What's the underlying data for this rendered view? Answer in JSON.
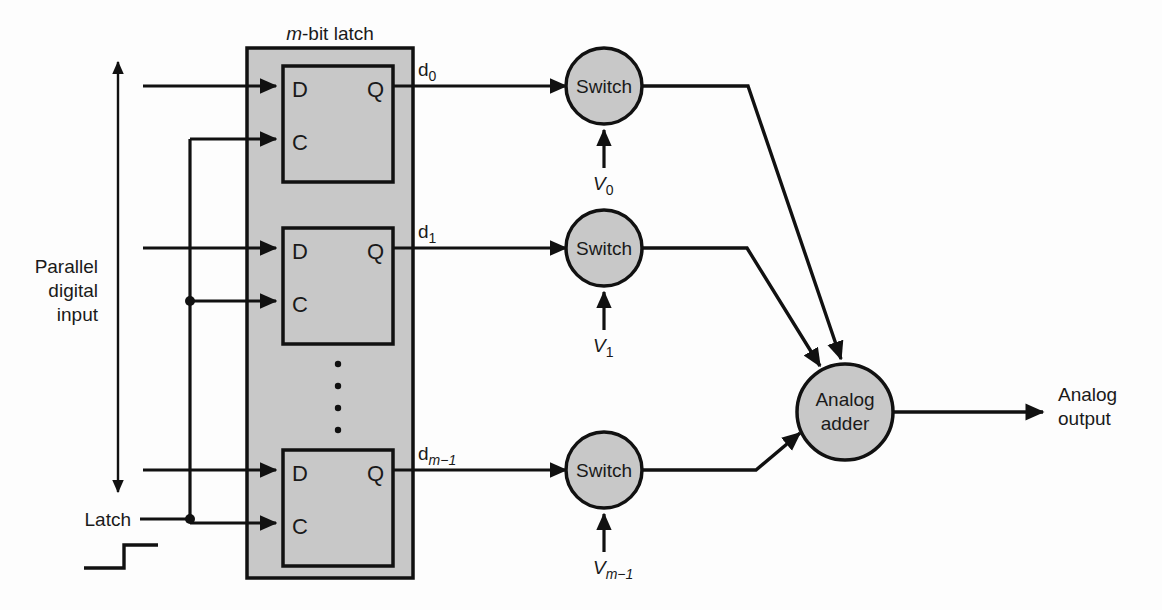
{
  "figure": {
    "type": "block-diagram",
    "title": "m-bit latch",
    "background_color": "#fdfdfd",
    "block_fill": "#c8c8c8",
    "line_color": "#111111"
  },
  "latch_block": {
    "title_m": "m",
    "title_rest": "-bit latch",
    "cells": [
      {
        "d_port": "D",
        "c_port": "C",
        "q_port": "Q"
      },
      {
        "d_port": "D",
        "c_port": "C",
        "q_port": "Q"
      },
      {
        "d_port": "D",
        "c_port": "C",
        "q_port": "Q"
      }
    ],
    "ellipsis": "·"
  },
  "signals": {
    "data_out": [
      {
        "base": "d",
        "sub": "0",
        "sub_italic": false
      },
      {
        "base": "d",
        "sub": "1",
        "sub_italic": false
      },
      {
        "base": "d",
        "sub": "m−1",
        "sub_italic": true
      }
    ],
    "references": [
      {
        "base": "V",
        "sub": "0",
        "sub_italic": false
      },
      {
        "base": "V",
        "sub": "1",
        "sub_italic": false
      },
      {
        "base": "V",
        "sub": "m−1",
        "sub_italic": true
      }
    ]
  },
  "nodes": {
    "switches": [
      {
        "label": "Switch"
      },
      {
        "label": "Switch"
      },
      {
        "label": "Switch"
      }
    ],
    "adder": {
      "line1": "Analog",
      "line2": "adder"
    }
  },
  "labels": {
    "parallel_input_line1": "Parallel",
    "parallel_input_line2": "digital",
    "parallel_input_line3": "input",
    "latch_input": "Latch",
    "analog_output_line1": "Analog",
    "analog_output_line2": "output"
  }
}
